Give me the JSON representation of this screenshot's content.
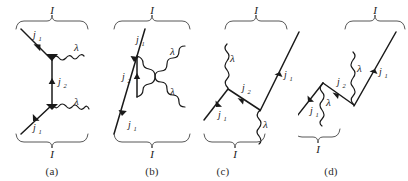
{
  "figure": {
    "kind": "feynman-diagram-set",
    "panel_count": 4,
    "ink_color": "#1a1a1a",
    "brace_color": "#444444",
    "background": "#ffffff"
  },
  "labels": {
    "I": "I",
    "j1": "j",
    "j1_sub": "1",
    "j2": "j",
    "j2_sub": "2",
    "lambda": "λ"
  },
  "panels": [
    {
      "id": "a",
      "caption": "(a)",
      "top_brace_label": "I",
      "bottom_brace_label": "I",
      "annotations": [
        {
          "name": "incoming-fermion-top",
          "text": "j",
          "sub": "1"
        },
        {
          "name": "emitted-boson-top",
          "text": "λ"
        },
        {
          "name": "exchanged-propagator",
          "text": "j",
          "sub": "2"
        },
        {
          "name": "emitted-boson-bottom",
          "text": "λ"
        },
        {
          "name": "incoming-fermion-bottom",
          "text": "j",
          "sub": "1"
        }
      ]
    },
    {
      "id": "b",
      "caption": "(b)",
      "top_brace_label": "I",
      "bottom_brace_label": "I",
      "annotations": [
        {
          "name": "incoming-fermion-top",
          "text": "j",
          "sub": "1"
        },
        {
          "name": "emitted-boson-top",
          "text": "λ"
        },
        {
          "name": "exchanged-propagator",
          "text": "j",
          "sub": "2"
        },
        {
          "name": "emitted-boson-bottom",
          "text": "λ"
        },
        {
          "name": "incoming-fermion-bottom",
          "text": "j",
          "sub": "1"
        }
      ]
    },
    {
      "id": "c",
      "caption": "(c)",
      "top_brace_label": "I",
      "bottom_brace_label": "I",
      "annotations": [
        {
          "name": "emitted-boson-top",
          "text": "λ"
        },
        {
          "name": "exchanged-propagator",
          "text": "j",
          "sub": "2"
        },
        {
          "name": "outgoing-fermion",
          "text": "j",
          "sub": "1"
        },
        {
          "name": "incoming-fermion",
          "text": "j",
          "sub": "1"
        },
        {
          "name": "emitted-boson-bottom",
          "text": "λ"
        }
      ]
    },
    {
      "id": "d",
      "caption": "(d)",
      "top_brace_label": "I",
      "bottom_brace_label": "I",
      "annotations": [
        {
          "name": "emitted-boson-top",
          "text": "λ"
        },
        {
          "name": "outgoing-fermion",
          "text": "j",
          "sub": "1"
        },
        {
          "name": "exchanged-propagator",
          "text": "j",
          "sub": "2"
        },
        {
          "name": "emitted-boson-bottom",
          "text": "λ"
        },
        {
          "name": "incoming-fermion",
          "text": "j",
          "sub": "1"
        }
      ]
    }
  ]
}
